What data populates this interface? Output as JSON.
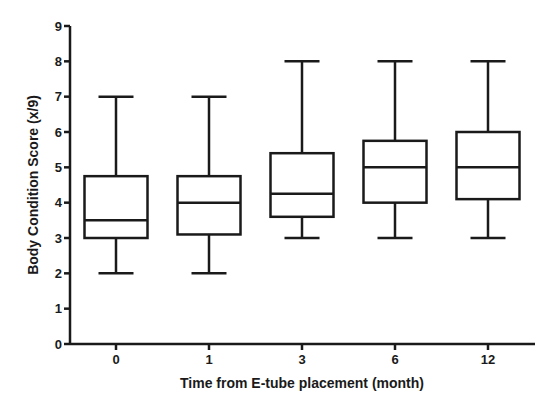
{
  "chart_data": {
    "type": "boxplot",
    "title": "",
    "xlabel": "Time from E-tube placement (month)",
    "ylabel": "Body Condition Score (x/9)",
    "ylim": [
      0,
      9
    ],
    "yticks": [
      0,
      1,
      2,
      3,
      4,
      5,
      6,
      7,
      8,
      9
    ],
    "grid": false,
    "legend": null,
    "categories": [
      "0",
      "1",
      "3",
      "6",
      "12"
    ],
    "series": [
      {
        "name": "Body Condition Score",
        "boxes": [
          {
            "category": "0",
            "min": 2,
            "q1": 3,
            "median": 3.5,
            "q3": 4.75,
            "max": 7
          },
          {
            "category": "1",
            "min": 2,
            "q1": 3.1,
            "median": 4,
            "q3": 4.75,
            "max": 7
          },
          {
            "category": "3",
            "min": 3,
            "q1": 3.6,
            "median": 4.25,
            "q3": 5.4,
            "max": 8
          },
          {
            "category": "6",
            "min": 3,
            "q1": 4,
            "median": 5,
            "q3": 5.75,
            "max": 8
          },
          {
            "category": "12",
            "min": 3,
            "q1": 4.1,
            "median": 5,
            "q3": 6,
            "max": 8
          }
        ]
      }
    ]
  },
  "colors": {
    "stroke": "#1a1a1a",
    "box_fill": "#ffffff",
    "background": "#ffffff"
  }
}
